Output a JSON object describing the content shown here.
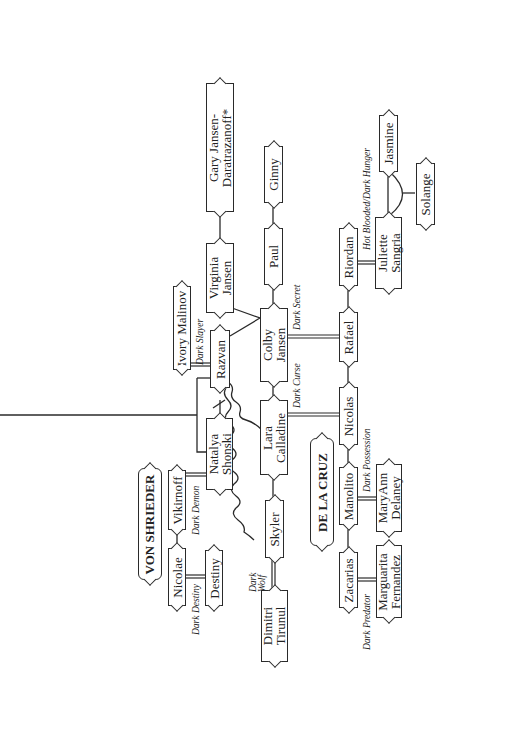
{
  "families": {
    "von_shrieder": "VON SHRIEDER",
    "de_la_cruz": "DE LA CRUZ"
  },
  "people": {
    "gary": "Gary Jansen-Daratrazanoff*",
    "virginia": "Virginia Jansen",
    "ginny": "Ginny",
    "paul": "Paul",
    "colby": "Colby Jansen",
    "ivory": "Ivory Malinov",
    "razvan": "Razvan",
    "natalya": "Natalya Shonski",
    "lara": "Lara Calladine",
    "vikirnoff": "Vikirnoff",
    "nicolae": "Nicolae",
    "destiny": "Destiny",
    "skyler": "Skyler",
    "dimitri": "Dimitri Tirunul",
    "riordan": "Riordan",
    "juliette": "Juliette Sangria",
    "jasmine": "Jasmine",
    "solange": "Solange",
    "rafael": "Rafael",
    "nicolas": "Nicolas",
    "manolito": "Manolito",
    "maryann": "MaryAnn Delaney",
    "zacarias": "Zacarias",
    "marguarita": "Marguarita Fernandez"
  },
  "books": {
    "dark_slayer": "Dark Slayer",
    "dark_secret": "Dark Secret",
    "dark_curse": "Dark Curse",
    "dark_demon": "Dark Demon",
    "dark_destiny": "Dark Destiny",
    "dark_wolf": "Dark Wolf",
    "dark_possession": "Dark Possession",
    "dark_predator": "Dark Predator",
    "hot_blooded": "Hot Blooded/Dark Hunger"
  }
}
